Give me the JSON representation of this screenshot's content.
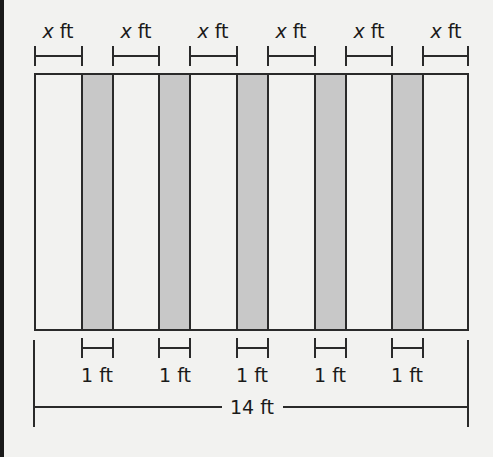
{
  "diagram": {
    "top_labels": [
      {
        "var": "x",
        "unit": "ft"
      },
      {
        "var": "x",
        "unit": "ft"
      },
      {
        "var": "x",
        "unit": "ft"
      },
      {
        "var": "x",
        "unit": "ft"
      },
      {
        "var": "x",
        "unit": "ft"
      },
      {
        "var": "x",
        "unit": "ft"
      }
    ],
    "bottom_labels": [
      "1 ft",
      "1 ft",
      "1 ft",
      "1 ft",
      "1 ft"
    ],
    "total_label": "14 ft",
    "colors": {
      "strip_fill": "#c8c8c8",
      "line": "#2a2a2a",
      "background": "#f2f2f0"
    }
  }
}
